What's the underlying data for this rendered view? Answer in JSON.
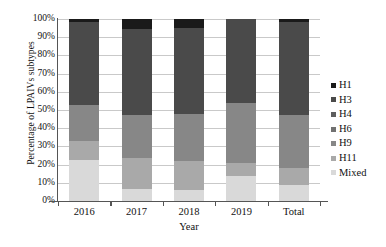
{
  "chart_data": {
    "type": "bar",
    "subtype": "stacked-100-percent",
    "title": "",
    "xlabel": "Year",
    "ylabel": "Percentage of LPAIVs subtypes",
    "categories": [
      "2016",
      "2017",
      "2018",
      "2019",
      "Total"
    ],
    "ylim": [
      0,
      100
    ],
    "ytick_labels": [
      "0%",
      "10%",
      "20%",
      "30%",
      "40%",
      "50%",
      "60%",
      "70%",
      "80%",
      "90%",
      "100%"
    ],
    "ytick_values": [
      0,
      10,
      20,
      30,
      40,
      50,
      60,
      70,
      80,
      90,
      100
    ],
    "grid": true,
    "legend_position": "right",
    "stack_order_bottom_to_top": [
      "Mixed",
      "H11",
      "H9",
      "H6",
      "H4",
      "H3",
      "H1"
    ],
    "series": [
      {
        "name": "H1",
        "color": "#1a1a1a",
        "values": [
          1.5,
          5.5,
          5.0,
          0.0,
          1.5
        ]
      },
      {
        "name": "H3",
        "color": "#4a4a4a",
        "values": [
          45.5,
          47.0,
          47.0,
          46.0,
          51.5
        ]
      },
      {
        "name": "H4",
        "color": "#5e5e5e",
        "values": [
          0.0,
          0.0,
          0.0,
          0.0,
          0.0
        ]
      },
      {
        "name": "H6",
        "color": "#717171",
        "values": [
          0.0,
          0.0,
          0.0,
          0.0,
          0.0
        ]
      },
      {
        "name": "H9",
        "color": "#878787",
        "values": [
          20.0,
          24.0,
          26.0,
          33.0,
          29.0
        ]
      },
      {
        "name": "H11",
        "color": "#a9a9a9",
        "values": [
          10.5,
          17.0,
          16.0,
          7.0,
          9.0
        ]
      },
      {
        "name": "Mixed",
        "color": "#d9d9d9",
        "values": [
          22.5,
          6.5,
          6.0,
          14.0,
          9.0
        ]
      }
    ]
  },
  "legend": {
    "items": [
      {
        "label": "H1",
        "color": "#1a1a1a"
      },
      {
        "label": "H3",
        "color": "#4a4a4a"
      },
      {
        "label": "H4",
        "color": "#5e5e5e"
      },
      {
        "label": "H6",
        "color": "#717171"
      },
      {
        "label": "H9",
        "color": "#878787"
      },
      {
        "label": "H11",
        "color": "#a9a9a9"
      },
      {
        "label": "Mixed",
        "color": "#d9d9d9"
      }
    ]
  },
  "axes": {
    "y_title": "Percentage of LPAIVs subtypes",
    "x_title": "Year"
  }
}
